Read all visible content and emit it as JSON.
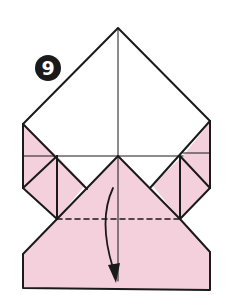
{
  "step": {
    "number": "9"
  },
  "colors": {
    "paper_front": "#ffffff",
    "paper_back": "#f4cfdc",
    "line": "#1a1a1a",
    "badge_bg": "#1a1a1a",
    "badge_text": "#ffffff"
  },
  "diagram": {
    "type": "origami-step",
    "instruction_symbols": [
      {
        "type": "valley-fold-line",
        "style": "dashed",
        "orientation": "horizontal"
      },
      {
        "type": "fold-arrow",
        "direction": "down"
      }
    ]
  }
}
